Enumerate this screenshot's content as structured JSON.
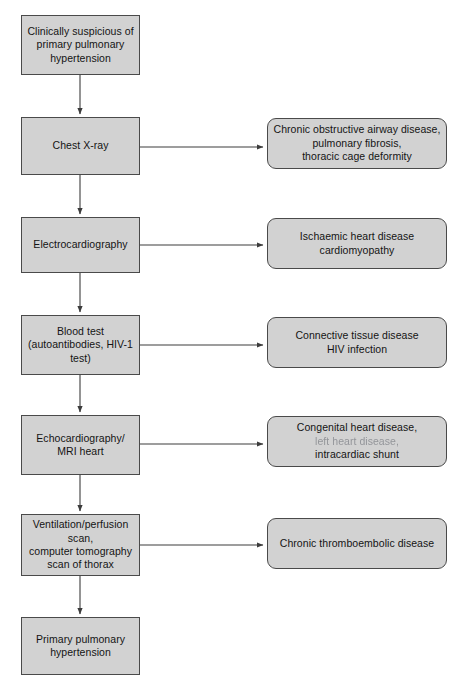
{
  "diagram": {
    "colors": {
      "node_fill": "#d2d2d2",
      "node_border": "#4a4a4a",
      "edge": "#3c3c3c",
      "text": "#141414",
      "background": "#ffffff"
    },
    "steps": [
      {
        "id": "step-clinical-suspicion",
        "label": "Clinically suspicious of\nprimary pulmonary\nhypertension",
        "x": 21,
        "y": 15,
        "w": 119,
        "h": 60
      },
      {
        "id": "step-chest-xray",
        "label": "Chest X-ray",
        "x": 21,
        "y": 117,
        "w": 119,
        "h": 58
      },
      {
        "id": "step-electrocardiography",
        "label": "Electrocardiography",
        "x": 21,
        "y": 217,
        "w": 119,
        "h": 56
      },
      {
        "id": "step-blood-test",
        "label": "Blood test\n(autoantibodies, HIV-1\ntest)",
        "x": 21,
        "y": 315,
        "w": 119,
        "h": 60
      },
      {
        "id": "step-echocardiography",
        "label": "Echocardiography/\nMRI heart",
        "x": 21,
        "y": 415,
        "w": 119,
        "h": 60
      },
      {
        "id": "step-ventilation-perfusion",
        "label": "Ventilation/perfusion\nscan,\ncomputer tomography\nscan of thorax",
        "x": 21,
        "y": 514,
        "w": 119,
        "h": 62
      },
      {
        "id": "step-primary-pulmonary-hypertension",
        "label": "Primary pulmonary\nhypertension",
        "x": 21,
        "y": 617,
        "w": 119,
        "h": 58
      }
    ],
    "branches": [
      {
        "id": "branch-chest-xray-findings",
        "label": "Chronic obstructive airway disease,\npulmonary fibrosis,\nthoracic cage deformity",
        "x": 267,
        "y": 118,
        "w": 180,
        "h": 51,
        "from_step": 1
      },
      {
        "id": "branch-ecg-findings",
        "label": "Ischaemic heart disease\ncardiomyopathy",
        "x": 267,
        "y": 218,
        "w": 180,
        "h": 51,
        "from_step": 2
      },
      {
        "id": "branch-blood-test-findings",
        "label": "Connective tissue disease\nHIV infection",
        "x": 267,
        "y": 317,
        "w": 180,
        "h": 51,
        "from_step": 3
      },
      {
        "id": "branch-echo-findings",
        "label_line1": "Congenital heart disease,",
        "label_line2": "left heart disease,",
        "label_line3": "intracardiac shunt",
        "x": 267,
        "y": 416,
        "w": 180,
        "h": 51,
        "from_step": 4
      },
      {
        "id": "branch-vq-ct-findings",
        "label": "Chronic thromboembolic disease",
        "x": 267,
        "y": 518,
        "w": 180,
        "h": 51,
        "from_step": 5
      }
    ],
    "vertical_edges": [
      {
        "id": "edge-suspicion-to-xray",
        "x": 80,
        "y1": 75,
        "y2": 117
      },
      {
        "id": "edge-xray-to-ecg",
        "x": 80,
        "y1": 175,
        "y2": 217
      },
      {
        "id": "edge-ecg-to-bloodtest",
        "x": 80,
        "y1": 273,
        "y2": 315
      },
      {
        "id": "edge-bloodtest-to-echo",
        "x": 80,
        "y1": 375,
        "y2": 415
      },
      {
        "id": "edge-echo-to-vq",
        "x": 80,
        "y1": 475,
        "y2": 514
      },
      {
        "id": "edge-vq-to-pph",
        "x": 80,
        "y1": 576,
        "y2": 617
      }
    ],
    "horizontal_edges": [
      {
        "id": "edge-xray-to-branch",
        "x1": 140,
        "x2": 266,
        "y": 147
      },
      {
        "id": "edge-ecg-to-branch",
        "x1": 140,
        "x2": 266,
        "y": 245
      },
      {
        "id": "edge-bloodtest-to-branch",
        "x1": 140,
        "x2": 266,
        "y": 345
      },
      {
        "id": "edge-echo-to-branch",
        "x1": 140,
        "x2": 266,
        "y": 444
      },
      {
        "id": "edge-vq-to-branch",
        "x1": 140,
        "x2": 266,
        "y": 545
      }
    ]
  }
}
